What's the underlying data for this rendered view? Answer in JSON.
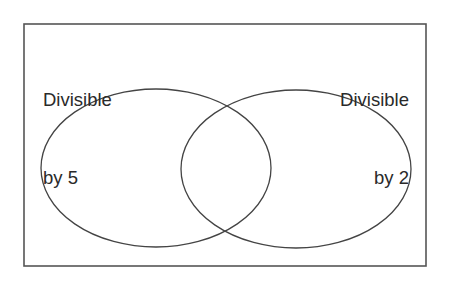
{
  "diagram": {
    "type": "venn",
    "universe": {
      "shape": "rectangle",
      "x": 24,
      "y": 24,
      "width": 402,
      "height": 242,
      "stroke": "#555555"
    },
    "sets": [
      {
        "id": "div5",
        "label_line1": "Divisible",
        "label_line2": "by 5",
        "label_align": "left",
        "shape": "ellipse",
        "cx": 156,
        "cy": 168,
        "rx": 115,
        "ry": 79,
        "stroke": "#444444"
      },
      {
        "id": "div2",
        "label_line1": "Divisible",
        "label_line2": "by 2",
        "label_align": "right",
        "shape": "ellipse",
        "cx": 296,
        "cy": 169,
        "rx": 115,
        "ry": 79,
        "stroke": "#444444"
      }
    ]
  }
}
